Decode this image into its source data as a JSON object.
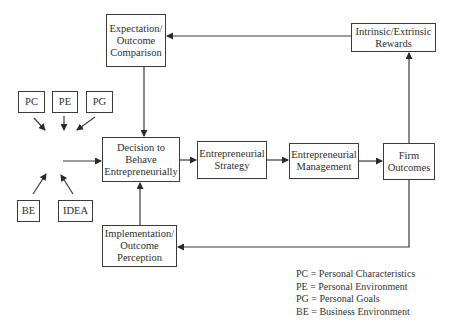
{
  "diagram": {
    "nodes": {
      "expectation": "Expectation/ Outcome Comparison",
      "decision": "Decision to Behave Entrepreneurially",
      "strategy": "Entrepreneurial Strategy",
      "management": "Entrepreneurial Management",
      "firm": "Firm Outcomes",
      "rewards": "Intrinsic/Extrinsic Rewards",
      "implementation": "Implementation/ Outcome Perception",
      "pc": "PC",
      "pe": "PE",
      "pg": "PG",
      "be": "BE",
      "idea": "IDEA"
    },
    "edges": [
      {
        "from": "pc",
        "to": "input-point"
      },
      {
        "from": "pe",
        "to": "input-point"
      },
      {
        "from": "pg",
        "to": "input-point"
      },
      {
        "from": "be",
        "to": "input-point"
      },
      {
        "from": "idea",
        "to": "input-point"
      },
      {
        "from": "input-point",
        "to": "decision"
      },
      {
        "from": "decision",
        "to": "strategy"
      },
      {
        "from": "strategy",
        "to": "management"
      },
      {
        "from": "management",
        "to": "firm"
      },
      {
        "from": "firm",
        "to": "rewards"
      },
      {
        "from": "rewards",
        "to": "expectation"
      },
      {
        "from": "expectation",
        "to": "decision"
      },
      {
        "from": "firm",
        "to": "implementation"
      },
      {
        "from": "implementation",
        "to": "decision"
      }
    ],
    "legend": [
      "PC = Personal Characteristics",
      "PE = Personal Environment",
      "PG = Personal Goals",
      "BE = Business Environment"
    ]
  }
}
